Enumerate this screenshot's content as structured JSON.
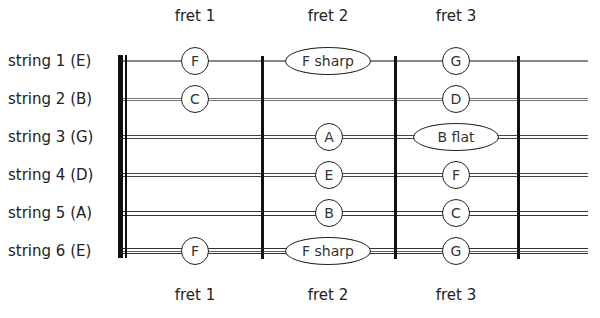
{
  "diagram": {
    "fret_labels_top": [
      "fret 1",
      "fret 2",
      "fret 3"
    ],
    "fret_labels_bottom": [
      "fret 1",
      "fret 2",
      "fret 3"
    ],
    "strings": [
      {
        "label": "string 1 (E)",
        "y": 61,
        "style": "thin"
      },
      {
        "label": "string 2 (B)",
        "y": 99,
        "style": "thin2"
      },
      {
        "label": "string 3 (G)",
        "y": 137,
        "style": "double"
      },
      {
        "label": "string 4 (D)",
        "y": 175,
        "style": "double"
      },
      {
        "label": "string 5 (A)",
        "y": 213,
        "style": "double"
      },
      {
        "label": "string 6 (E)",
        "y": 251,
        "style": "triple"
      }
    ],
    "fret_x": [
      262,
      395,
      518
    ],
    "label_x": [
      195,
      328,
      456
    ],
    "notes": [
      {
        "string": 1,
        "fret": 1,
        "name": "F"
      },
      {
        "string": 1,
        "fret": 2,
        "name": "F sharp"
      },
      {
        "string": 1,
        "fret": 3,
        "name": "G"
      },
      {
        "string": 2,
        "fret": 1,
        "name": "C"
      },
      {
        "string": 2,
        "fret": 3,
        "name": "D"
      },
      {
        "string": 3,
        "fret": 2,
        "name": "A"
      },
      {
        "string": 3,
        "fret": 3,
        "name": "B flat"
      },
      {
        "string": 4,
        "fret": 2,
        "name": "E"
      },
      {
        "string": 4,
        "fret": 3,
        "name": "F"
      },
      {
        "string": 5,
        "fret": 2,
        "name": "B"
      },
      {
        "string": 5,
        "fret": 3,
        "name": "C"
      },
      {
        "string": 6,
        "fret": 1,
        "name": "F"
      },
      {
        "string": 6,
        "fret": 2,
        "name": "F sharp"
      },
      {
        "string": 6,
        "fret": 3,
        "name": "G"
      }
    ]
  }
}
